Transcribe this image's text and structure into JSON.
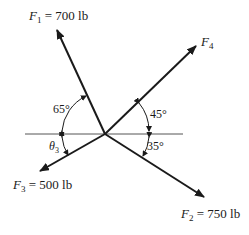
{
  "diagram": {
    "type": "force-vector-diagram",
    "reference_line": "horizontal",
    "forces": [
      {
        "id": "F1",
        "symbol": "F",
        "subscript": "1",
        "value": "700 lb",
        "label_eq": " = 700 lb",
        "direction": "up-left",
        "angle_label": "65°",
        "angle_reference": "horizontal (left)"
      },
      {
        "id": "F2",
        "symbol": "F",
        "subscript": "2",
        "value": "750 lb",
        "label_eq": " = 750 lb",
        "direction": "down-right",
        "angle_label": "35°",
        "angle_reference": "horizontal (right)"
      },
      {
        "id": "F3",
        "symbol": "F",
        "subscript": "3",
        "value": "500 lb",
        "label_eq": " = 500 lb",
        "direction": "down-left",
        "angle_label": "θ",
        "angle_label_sub": "3",
        "angle_reference": "horizontal (left)"
      },
      {
        "id": "F4",
        "symbol": "F",
        "subscript": "4",
        "value": "",
        "label_eq": "",
        "direction": "up-right",
        "angle_label": "45°",
        "angle_reference": "horizontal (right)"
      }
    ]
  },
  "colors": {
    "ink": "#1a1a1a",
    "line": "#555555",
    "background": "#ffffff"
  }
}
